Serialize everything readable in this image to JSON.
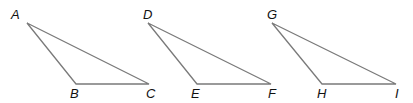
{
  "diagram": {
    "type": "three congruent obtuse triangles",
    "line_color": "#7a7a7a",
    "label_color": "#111111",
    "triangles": [
      {
        "name": "ABC",
        "vertices": [
          {
            "label": "A",
            "x": 27,
            "y": 23,
            "lx": 11,
            "ly": 19
          },
          {
            "label": "B",
            "x": 76,
            "y": 84,
            "lx": 70,
            "ly": 98
          },
          {
            "label": "C",
            "x": 149,
            "y": 84,
            "lx": 146,
            "ly": 98
          }
        ]
      },
      {
        "name": "DEF",
        "vertices": [
          {
            "label": "D",
            "x": 148,
            "y": 23,
            "lx": 143,
            "ly": 19
          },
          {
            "label": "E",
            "x": 197,
            "y": 84,
            "lx": 191,
            "ly": 98
          },
          {
            "label": "F",
            "x": 271,
            "y": 84,
            "lx": 268,
            "ly": 98
          }
        ]
      },
      {
        "name": "GHI",
        "vertices": [
          {
            "label": "G",
            "x": 272,
            "y": 23,
            "lx": 267,
            "ly": 19
          },
          {
            "label": "H",
            "x": 322,
            "y": 84,
            "lx": 317,
            "ly": 98
          },
          {
            "label": "I",
            "x": 396,
            "y": 84,
            "lx": 395,
            "ly": 98
          }
        ]
      }
    ]
  }
}
